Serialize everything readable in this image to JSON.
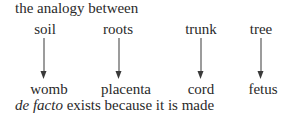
{
  "intro": "the analogy between",
  "top_labels": [
    "soil",
    "roots",
    "trunk",
    "tree"
  ],
  "bottom_labels": [
    "womb",
    "placenta",
    "cord",
    "fetus"
  ],
  "conclusion": {
    "italic": "de facto",
    "rest": " exists because it is made"
  },
  "arrows": [
    {
      "from": "soil",
      "to": "womb"
    },
    {
      "from": "roots",
      "to": "placenta"
    },
    {
      "from": "trunk",
      "to": "cord"
    },
    {
      "from": "tree",
      "to": "fetus"
    }
  ]
}
